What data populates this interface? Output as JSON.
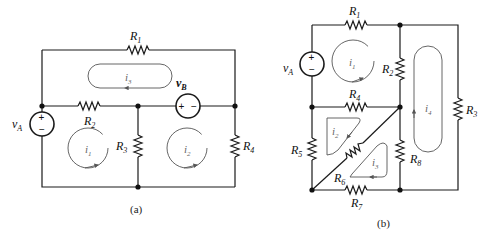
{
  "figure": {
    "panel_a": {
      "caption": "(a)",
      "resistors": [
        {
          "label": "R",
          "sub": "1"
        },
        {
          "label": "R",
          "sub": "2"
        },
        {
          "label": "R",
          "sub": "3"
        },
        {
          "label": "R",
          "sub": "4"
        }
      ],
      "sources": [
        {
          "label": "v",
          "sub": "A",
          "plus": "+",
          "minus": "−"
        },
        {
          "label": "v",
          "sub": "B",
          "plus": "+",
          "minus": "−"
        }
      ],
      "mesh_currents": [
        {
          "label": "i",
          "sub": "1"
        },
        {
          "label": "i",
          "sub": "2"
        },
        {
          "label": "i",
          "sub": "3"
        }
      ]
    },
    "panel_b": {
      "caption": "(b)",
      "resistors": [
        {
          "label": "R",
          "sub": "1"
        },
        {
          "label": "R",
          "sub": "2"
        },
        {
          "label": "R",
          "sub": "3"
        },
        {
          "label": "R",
          "sub": "4"
        },
        {
          "label": "R",
          "sub": "5"
        },
        {
          "label": "R",
          "sub": "6"
        },
        {
          "label": "R",
          "sub": "7"
        },
        {
          "label": "R",
          "sub": "8"
        }
      ],
      "sources": [
        {
          "label": "v",
          "sub": "A",
          "plus": "+",
          "minus": "−"
        }
      ],
      "mesh_currents": [
        {
          "label": "i",
          "sub": "1"
        },
        {
          "label": "i",
          "sub": "2"
        },
        {
          "label": "i",
          "sub": "3"
        },
        {
          "label": "i",
          "sub": "4"
        }
      ]
    }
  }
}
